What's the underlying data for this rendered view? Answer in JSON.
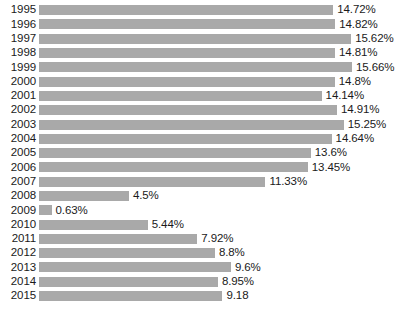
{
  "chart_data": {
    "type": "bar",
    "orientation": "horizontal",
    "title": "",
    "subtitle": "",
    "xlabel": "",
    "ylabel": "",
    "grid": false,
    "legend": null,
    "legend_position": "none",
    "xlim": [
      0,
      15.66
    ],
    "bar_color": "#a9a9a9",
    "background_color": "#ffffff",
    "text_color": "#1a1a1a",
    "categories": [
      "1995",
      "1996",
      "1997",
      "1998",
      "1999",
      "2000",
      "2001",
      "2002",
      "2003",
      "2004",
      "2005",
      "2006",
      "2007",
      "2008",
      "2009",
      "2010",
      "2011",
      "2012",
      "2013",
      "2014",
      "2015"
    ],
    "values": [
      14.72,
      14.82,
      15.62,
      14.81,
      15.66,
      14.8,
      14.14,
      14.91,
      15.25,
      14.64,
      13.6,
      13.45,
      11.33,
      4.5,
      0.63,
      5.44,
      7.92,
      8.8,
      9.6,
      8.95,
      9.18
    ],
    "data_labels": [
      "14.72%",
      "14.82%",
      "15.62%",
      "14.81%",
      "15.66%",
      "14.8%",
      "14.14%",
      "14.91%",
      "15.25%",
      "14.64%",
      "13.6%",
      "13.45%",
      "11.33%",
      "4.5%",
      "0.63%",
      "5.44%",
      "7.92%",
      "8.8%",
      "9.6%",
      "8.95%",
      "9.18"
    ],
    "points": [
      {
        "category": "1995",
        "value": 14.72,
        "label": "14.72%"
      },
      {
        "category": "1996",
        "value": 14.82,
        "label": "14.82%"
      },
      {
        "category": "1997",
        "value": 15.62,
        "label": "15.62%"
      },
      {
        "category": "1998",
        "value": 14.81,
        "label": "14.81%"
      },
      {
        "category": "1999",
        "value": 15.66,
        "label": "15.66%"
      },
      {
        "category": "2000",
        "value": 14.8,
        "label": "14.8%"
      },
      {
        "category": "2001",
        "value": 14.14,
        "label": "14.14%"
      },
      {
        "category": "2002",
        "value": 14.91,
        "label": "14.91%"
      },
      {
        "category": "2003",
        "value": 15.25,
        "label": "15.25%"
      },
      {
        "category": "2004",
        "value": 14.64,
        "label": "14.64%"
      },
      {
        "category": "2005",
        "value": 13.6,
        "label": "13.6%"
      },
      {
        "category": "2006",
        "value": 13.45,
        "label": "13.45%"
      },
      {
        "category": "2007",
        "value": 11.33,
        "label": "11.33%"
      },
      {
        "category": "2008",
        "value": 4.5,
        "label": "4.5%"
      },
      {
        "category": "2009",
        "value": 0.63,
        "label": "0.63%"
      },
      {
        "category": "2010",
        "value": 5.44,
        "label": "5.44%"
      },
      {
        "category": "2011",
        "value": 7.92,
        "label": "7.92%"
      },
      {
        "category": "2012",
        "value": 8.8,
        "label": "8.8%"
      },
      {
        "category": "2013",
        "value": 9.6,
        "label": "9.6%"
      },
      {
        "category": "2014",
        "value": 8.95,
        "label": "8.95%"
      },
      {
        "category": "2015",
        "value": 9.18,
        "label": "9.18"
      }
    ]
  }
}
